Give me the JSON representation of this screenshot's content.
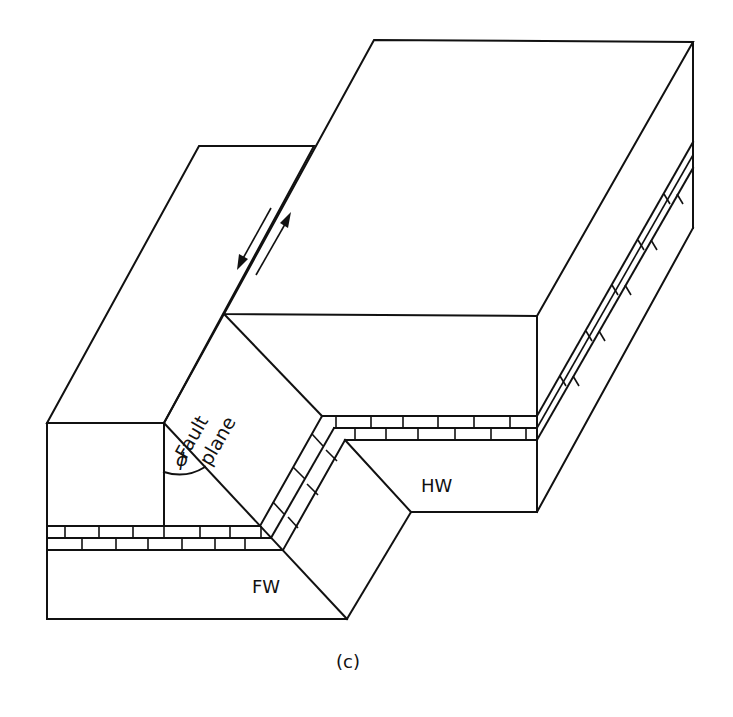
{
  "figure": {
    "caption": "(c)",
    "labels": {
      "fault_plane_line1": "Fault",
      "fault_plane_line2": "plane",
      "angle": "ϕ",
      "hanging_wall": "HW",
      "footwall": "FW"
    },
    "elements": [
      "footwall block (FW)",
      "hanging wall block (HW)",
      "fault plane",
      "dip angle ϕ",
      "brick-patterned marker bed (offset across fault)",
      "opposing slip arrows along fault trace"
    ],
    "colors": {
      "ink": "#111111",
      "background": "#ffffff"
    }
  }
}
